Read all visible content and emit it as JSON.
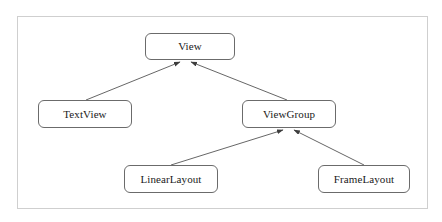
{
  "diagram": {
    "type": "class-hierarchy",
    "title": "",
    "background_color": "#ffffff",
    "frame_border_color": "#cfcfcf",
    "node_border_color": "#6b6b6b",
    "node_fill_color": "#ffffff",
    "edge_color": "#555555",
    "text_color": "#1a1a1a",
    "nodes": [
      {
        "id": "view",
        "label": "View",
        "x": 145,
        "y": 33,
        "width": 90,
        "height": 27
      },
      {
        "id": "textview",
        "label": "TextView",
        "x": 38,
        "y": 100,
        "width": 94,
        "height": 28
      },
      {
        "id": "viewgroup",
        "label": "ViewGroup",
        "x": 242,
        "y": 100,
        "width": 94,
        "height": 28
      },
      {
        "id": "linearlayout",
        "label": "LinearLayout",
        "x": 124,
        "y": 165,
        "width": 94,
        "height": 28
      },
      {
        "id": "framelayout",
        "label": "FrameLayout",
        "x": 318,
        "y": 165,
        "width": 92,
        "height": 28
      }
    ],
    "edges": [
      {
        "id": "textview-to-view",
        "from": "textview",
        "to": "view",
        "relation": "generalization",
        "arrow_at": "to"
      },
      {
        "id": "viewgroup-to-view",
        "from": "viewgroup",
        "to": "view",
        "relation": "generalization",
        "arrow_at": "to"
      },
      {
        "id": "linearlayout-to-viewgroup",
        "from": "linearlayout",
        "to": "viewgroup",
        "relation": "generalization",
        "arrow_at": "to"
      },
      {
        "id": "framelayout-to-viewgroup",
        "from": "framelayout",
        "to": "viewgroup",
        "relation": "generalization",
        "arrow_at": "to"
      }
    ]
  }
}
